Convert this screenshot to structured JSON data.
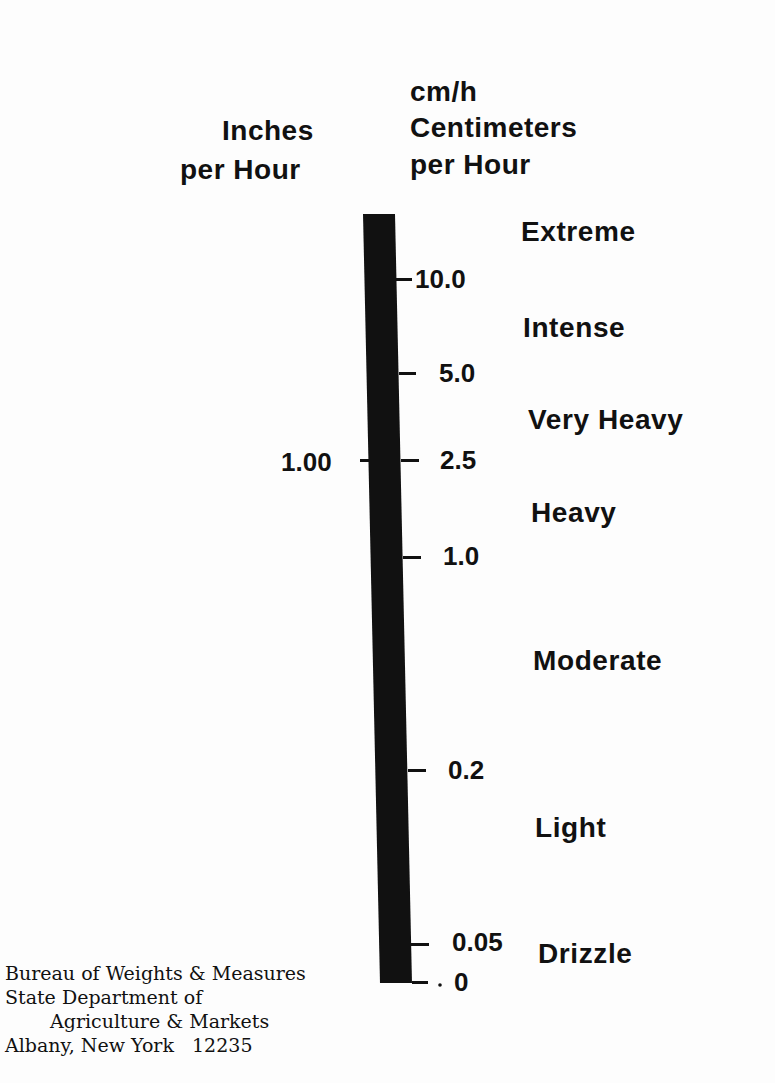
{
  "headers": {
    "left": {
      "line1": "Inches",
      "line2": "per Hour"
    },
    "right": {
      "abbr": "cm/h",
      "line1": "Centimeters",
      "line2": "per Hour"
    }
  },
  "scale": {
    "inch_ticks": [
      {
        "label": "1.00",
        "cm_equiv": 2.5
      }
    ],
    "cm_ticks": [
      {
        "label": "10.0"
      },
      {
        "label": "5.0"
      },
      {
        "label": "2.5"
      },
      {
        "label": "1.0"
      },
      {
        "label": "0.2"
      },
      {
        "label": "0.05"
      },
      {
        "label": "0"
      }
    ]
  },
  "categories": [
    {
      "label": "Extreme",
      "range_cm_h": ">10.0"
    },
    {
      "label": "Intense",
      "range_cm_h": "5.0-10.0"
    },
    {
      "label": "Very Heavy",
      "range_cm_h": "2.5-5.0"
    },
    {
      "label": "Heavy",
      "range_cm_h": "1.0-2.5"
    },
    {
      "label": "Moderate",
      "range_cm_h": "0.2-1.0"
    },
    {
      "label": "Light",
      "range_cm_h": "0.05-0.2"
    },
    {
      "label": "Drizzle",
      "range_cm_h": "0-0.05"
    }
  ],
  "footer": {
    "line1": "Bureau of Weights & Measures",
    "line2": "State Department of",
    "line3": "Agriculture & Markets",
    "line4": "Albany, New York   12235"
  },
  "colors": {
    "ink": "#111111",
    "paper": "#fdfdfd"
  }
}
